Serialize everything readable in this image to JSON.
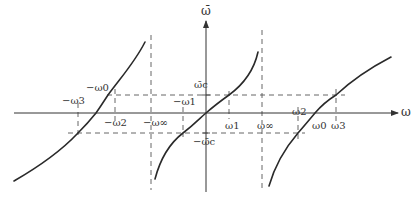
{
  "diagram": {
    "type": "tangent-like frequency mapping plot",
    "axes": {
      "x_label": "ω",
      "y_label": "ω̄"
    },
    "horizontal_levels": {
      "upper": "ω̄c",
      "lower": "−ω̄c"
    },
    "asymptotes": {
      "left": "−ω∞",
      "right": "ω∞"
    },
    "labels": {
      "neg_omega3": "−ω3",
      "neg_omega0": "−ω0",
      "neg_omega2": "−ω2",
      "neg_omega1": "−ω1",
      "neg_omega_inf": "−ω∞",
      "omega1": "ω1",
      "omega_inf": "ω∞",
      "omega2": "ω2",
      "omega0": "ω0",
      "omega3": "ω3",
      "omega_c_bar": "ω̄c",
      "neg_omega_c_bar": "−ω̄c"
    },
    "branches": [
      "left-branch",
      "center-branch",
      "right-branch"
    ],
    "colors": {
      "curve": "#2a2a2a",
      "axis": "#333333",
      "dashed": "#555555"
    }
  }
}
